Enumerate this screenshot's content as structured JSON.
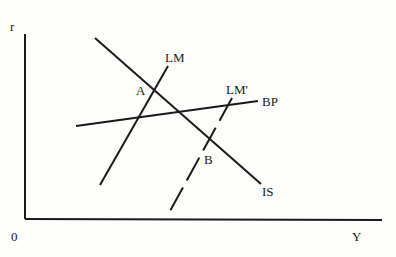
{
  "diagram": {
    "type": "IS-LM-BP",
    "axes": {
      "y_label": "r",
      "x_label": "Y",
      "origin_label": "0"
    },
    "curves": [
      {
        "id": "IS",
        "label": "IS",
        "style": "solid"
      },
      {
        "id": "LM",
        "label": "LM",
        "style": "solid"
      },
      {
        "id": "LM_prime",
        "label": "LM'",
        "style": "dashed"
      },
      {
        "id": "BP",
        "label": "BP",
        "style": "solid"
      }
    ],
    "points": [
      {
        "id": "A",
        "label": "A"
      },
      {
        "id": "B",
        "label": "B"
      }
    ],
    "colors": {
      "ink": "#1a1a1a",
      "background": "#fdfdfc"
    }
  }
}
